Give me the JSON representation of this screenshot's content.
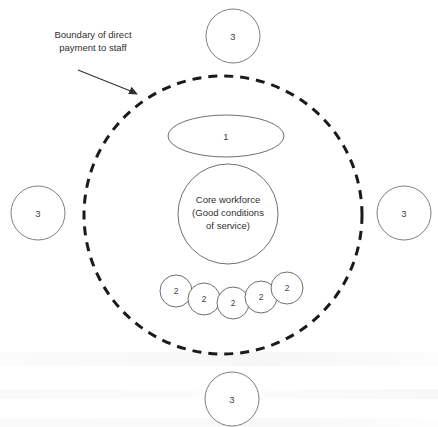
{
  "diagram": {
    "type": "concentric-flexible-firm-model",
    "background_color": "#ffffff",
    "callout": {
      "name": "boundary-callout",
      "line1": "Boundary of direct",
      "line2": "payment to staff",
      "arrow_from": [
        78,
        70
      ],
      "arrow_to": [
        137,
        94
      ]
    },
    "boundary": {
      "name": "boundary-of-direct-payment",
      "shape": "dashed-circle",
      "cx": 223,
      "cy": 215,
      "r": 139,
      "stroke_color": "#1a1a1a",
      "dash": "9 7",
      "stroke_width": 3
    },
    "core": {
      "name": "core-workforce",
      "shape": "circle",
      "cx": 228,
      "cy": 214,
      "r": 50,
      "label_lines": [
        "Core workforce",
        "(Good conditions",
        "of service)"
      ],
      "stroke_color": "#6f6f6f"
    },
    "group_one": {
      "name": "group-1-ellipse",
      "shape": "ellipse",
      "cx": 226,
      "cy": 136,
      "rx": 58,
      "ry": 21,
      "label": "1",
      "stroke_color": "#6f6f6f"
    },
    "group_two": {
      "name": "group-2-cluster",
      "shape": "circle-cluster",
      "label": "2",
      "radius": 16,
      "stroke_color": "#6f6f6f",
      "nodes": [
        {
          "cx": 176,
          "cy": 291,
          "label": "2"
        },
        {
          "cx": 204,
          "cy": 299,
          "label": "2"
        },
        {
          "cx": 233,
          "cy": 303,
          "label": "2"
        },
        {
          "cx": 261,
          "cy": 297,
          "label": "2"
        },
        {
          "cx": 287,
          "cy": 288,
          "label": "2"
        }
      ]
    },
    "group_three": {
      "name": "group-3-outer-circles",
      "shape": "circle",
      "radius": 27,
      "label": "3",
      "stroke_color": "#808080",
      "nodes": [
        {
          "position": "top",
          "cx": 233,
          "cy": 36,
          "label": "3"
        },
        {
          "position": "left",
          "cx": 38,
          "cy": 213,
          "label": "3"
        },
        {
          "position": "right",
          "cx": 404,
          "cy": 213,
          "label": "3"
        },
        {
          "position": "bottom",
          "cx": 232,
          "cy": 399,
          "label": "3"
        }
      ]
    }
  }
}
